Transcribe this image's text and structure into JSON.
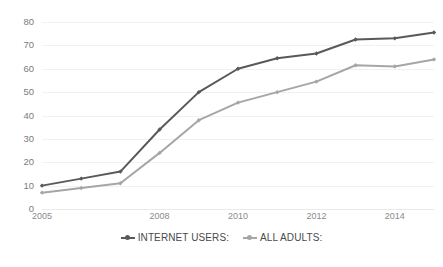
{
  "chart_data": {
    "type": "line",
    "title": "",
    "xlabel": "",
    "ylabel": "",
    "x": [
      2005,
      2006,
      2007,
      2008,
      2009,
      2010,
      2011,
      2012,
      2013,
      2014,
      2015
    ],
    "xlim": [
      2005,
      2015
    ],
    "ylim": [
      0,
      80
    ],
    "y_ticks": [
      0,
      10,
      20,
      30,
      40,
      50,
      60,
      70,
      80
    ],
    "x_tick_labels": [
      "2005",
      "2008",
      "2010",
      "2012",
      "2014"
    ],
    "x_tick_values": [
      2005,
      2008,
      2010,
      2012,
      2014
    ],
    "grid": "horizontal",
    "legend_position": "bottom",
    "series": [
      {
        "name": "INTERNET USERS:",
        "color": "#595959",
        "marker": "diamond",
        "values": [
          10,
          13,
          16,
          34,
          50,
          60,
          64.5,
          66.5,
          72.5,
          73,
          75.5
        ]
      },
      {
        "name": "ALL ADULTS:",
        "color": "#a6a6a6",
        "marker": "diamond",
        "values": [
          7,
          9,
          11,
          24,
          38,
          45.5,
          50,
          54.5,
          61.5,
          61,
          64
        ]
      }
    ]
  },
  "legend": {
    "items": [
      {
        "label": "INTERNET USERS:",
        "color": "#595959"
      },
      {
        "label": "ALL ADULTS:",
        "color": "#a6a6a6"
      }
    ]
  },
  "axes": {
    "y_labels": [
      "80",
      "70",
      "60",
      "50",
      "40",
      "30",
      "20",
      "10",
      "0"
    ],
    "x_labels": [
      "2005",
      "2008",
      "2010",
      "2012",
      "2014"
    ]
  }
}
